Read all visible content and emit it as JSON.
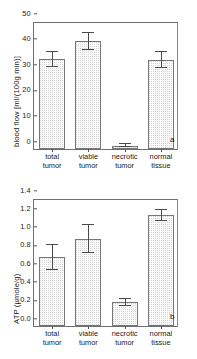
{
  "figure": {
    "panels": [
      {
        "letter": "a",
        "chart_data": {
          "type": "bar",
          "title": "",
          "xlabel": "",
          "ylabel": "blood flow [ml/(100g min)]",
          "ylim": [
            0,
            50
          ],
          "yticks": [
            0,
            10,
            20,
            30,
            40,
            50
          ],
          "ytick_labels": [
            "0",
            "10",
            "20",
            "30",
            "40",
            "50"
          ],
          "grid": false,
          "legend": "none",
          "categories": [
            "total tumor",
            "viable tumor",
            "necrotic tumor",
            "normal tissue"
          ],
          "category_lines": [
            [
              "total",
              "tumor"
            ],
            [
              "viable",
              "tumor"
            ],
            [
              "necrotic",
              "tumor"
            ],
            [
              "normal",
              "tissue"
            ]
          ],
          "values": [
            35.0,
            42.0,
            1.2,
            34.8
          ],
          "errors": [
            3.0,
            3.5,
            0.6,
            3.0
          ]
        }
      },
      {
        "letter": "b",
        "chart_data": {
          "type": "bar",
          "title": "",
          "xlabel": "",
          "ylabel": "ATP (µmole/g)",
          "ylim": [
            0.0,
            1.4
          ],
          "yticks": [
            0.0,
            0.2,
            0.4,
            0.6,
            0.8,
            1.0,
            1.2,
            1.4
          ],
          "ytick_labels": [
            "0.0",
            "0.2",
            "0.4",
            "0.6",
            "0.8",
            "1.0",
            "1.2",
            "1.4"
          ],
          "grid": false,
          "legend": "none",
          "categories": [
            "total tumor",
            "viable tumor",
            "necrotic tumor",
            "normal tissue"
          ],
          "category_lines": [
            [
              "total",
              "tumor"
            ],
            [
              "viable",
              "tumor"
            ],
            [
              "necrotic",
              "tumor"
            ],
            [
              "normal",
              "tissue"
            ]
          ],
          "values": [
            0.75,
            0.95,
            0.26,
            1.21
          ],
          "errors": [
            0.14,
            0.15,
            0.04,
            0.06
          ]
        }
      }
    ],
    "colors": {
      "bar_fill": "#fbfbfb",
      "bar_stipple": "#d6d6d6",
      "bar_edge": "#777777",
      "axis": "#6f6f6f",
      "error": "#4a4a4a",
      "text": "#1a1a1a",
      "background": "#ffffff"
    }
  }
}
